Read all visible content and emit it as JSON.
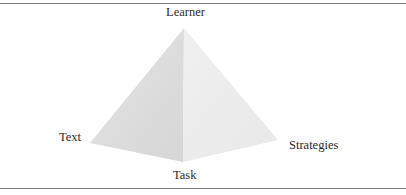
{
  "diagram": {
    "type": "pyramid",
    "vertices": {
      "apex": "Learner",
      "left": "Text",
      "bottom": "Task",
      "right": "Strategies"
    },
    "colors": {
      "left_face": "#dcdcdc",
      "right_face": "#ececec",
      "rules": "#7a7a7a",
      "text": "#2a2a2a"
    }
  }
}
